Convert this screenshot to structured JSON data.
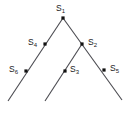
{
  "figure": {
    "type": "binary-tree-diagram",
    "background_color": "#ffffff",
    "line_color": "#4a4a50",
    "node_marker_color": "#111111",
    "label_color": "#1a1a1a",
    "root_label": "S1"
  },
  "nodes": [
    {
      "id": "s1",
      "name": "S",
      "subscript": "1",
      "role": "root",
      "x": 63,
      "y": 18,
      "label_x": 56,
      "label_y": 4,
      "label_align": "above"
    },
    {
      "id": "s4",
      "name": "S",
      "subscript": "4",
      "role": "internal",
      "x": 45,
      "y": 44,
      "label_x": 28,
      "label_y": 38,
      "label_align": "left"
    },
    {
      "id": "s2",
      "name": "S",
      "subscript": "2",
      "role": "internal",
      "x": 82,
      "y": 44,
      "label_x": 88,
      "label_y": 38,
      "label_align": "right"
    },
    {
      "id": "s6",
      "name": "S",
      "subscript": "6",
      "role": "leaf",
      "x": 26,
      "y": 71,
      "label_x": 9,
      "label_y": 65,
      "label_align": "left"
    },
    {
      "id": "s3",
      "name": "S",
      "subscript": "3",
      "role": "leaf",
      "x": 65,
      "y": 71,
      "label_x": 70,
      "label_y": 65,
      "label_align": "right"
    },
    {
      "id": "s5",
      "name": "S",
      "subscript": "5",
      "role": "leaf",
      "x": 104,
      "y": 70,
      "label_x": 110,
      "label_y": 64,
      "label_align": "right"
    }
  ],
  "edges": [
    {
      "id": "edge-root-left",
      "from": "s1",
      "to": "bottom-left",
      "x1": 63,
      "y1": 18,
      "x2": 8,
      "y2": 101
    },
    {
      "id": "edge-root-right",
      "from": "s1",
      "to": "bottom-right",
      "x1": 63,
      "y1": 18,
      "x2": 122,
      "y2": 100
    },
    {
      "id": "edge-s2-left",
      "from": "s2",
      "to": "bottom-middle",
      "x1": 82,
      "y1": 44,
      "x2": 45,
      "y2": 101
    }
  ]
}
